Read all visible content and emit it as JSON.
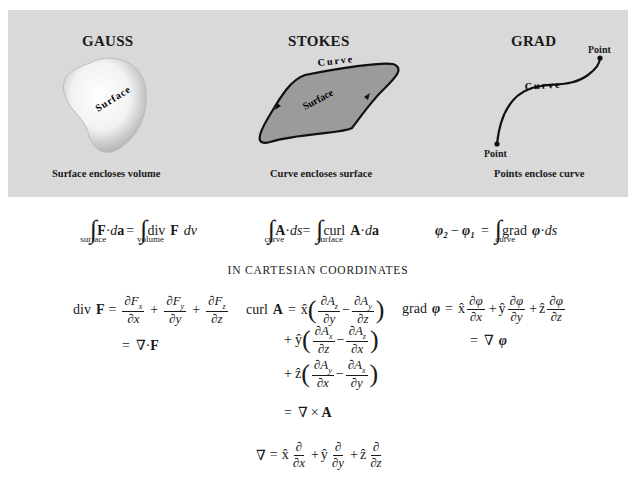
{
  "figure": {
    "background_color": "#d9d9d9",
    "panels": [
      {
        "title": "GAUSS",
        "shape_label": "Surface",
        "caption": "Surface encloses volume"
      },
      {
        "title": "STOKES",
        "curve_label": "Curve",
        "shape_label": "Surface",
        "caption": "Curve encloses surface"
      },
      {
        "title": "GRAD",
        "curve_label": "Curve",
        "point_top_label": "Point",
        "point_bottom_label": "Point",
        "caption": "Points enclose curve"
      }
    ]
  },
  "theorems": {
    "gauss": {
      "lhs_integrand": "F·da",
      "lhs_domain": "surface",
      "rhs_integrand": "div F dv",
      "rhs_domain": "volume"
    },
    "stokes": {
      "lhs_integrand": "A·ds",
      "lhs_domain": "curve",
      "rhs_integrand": "curl A·da",
      "rhs_domain": "surface"
    },
    "grad": {
      "lhs": "φ₂ − φ₁",
      "rhs_integrand": "grad φ·ds",
      "rhs_domain": "curve"
    }
  },
  "section_title": "IN CARTESIAN COORDINATES",
  "cartesian": {
    "div": {
      "lhs": "div F",
      "line1": "∂Fx/∂x + ∂Fy/∂y + ∂Fz/∂z",
      "line2": "= ∇·F"
    },
    "curl": {
      "lhs": "curl A",
      "line1": "x̂(∂Az/∂y − ∂Ay/∂z)",
      "line2": "+ ŷ(∂Ax/∂z − ∂Az/∂x)",
      "line3": "+ ẑ(∂Ay/∂x − ∂Ax/∂y)",
      "line4": "= ∇×A"
    },
    "grad": {
      "lhs": "grad φ",
      "line1": "x̂ ∂φ/∂x + ŷ ∂φ/∂y + ẑ ∂φ/∂z",
      "line2": "= ∇φ"
    },
    "nabla": "∇ = x̂ ∂/∂x + ŷ ∂/∂y + ẑ ∂/∂z"
  },
  "labels": {
    "surface": "surface",
    "volume": "volume",
    "curve": "curve",
    "div": "div",
    "curl": "curl",
    "grad": "grad",
    "eq": "=",
    "plus": "+",
    "minus": "−",
    "dot": "·",
    "F": "F",
    "A": "A",
    "phi": "φ",
    "nabla": "∇",
    "times": "×",
    "d": "d",
    "a": "a",
    "s": "s",
    "v": "v",
    "partial": "∂",
    "x": "x",
    "y": "y",
    "z": "z",
    "xhat": "x̂",
    "yhat": "ŷ",
    "zhat": "ẑ",
    "phi2": "φ₂",
    "phi1": "φ₁"
  }
}
